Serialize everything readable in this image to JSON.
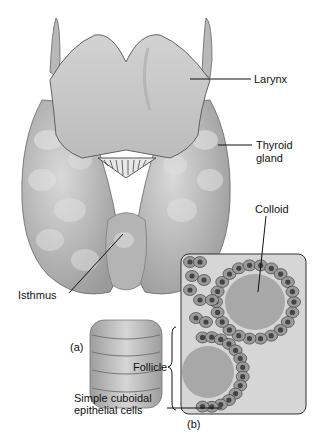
{
  "figure": {
    "panels": [
      {
        "id": "a",
        "label": "(a)",
        "subject": "thyroid gland anterior view"
      },
      {
        "id": "b",
        "label": "(b)",
        "subject": "thyroid follicles histology"
      }
    ]
  },
  "labels": {
    "larynx": "Larynx",
    "thyroid_line1": "Thyroid",
    "thyroid_line2": "gland",
    "colloid": "Colloid",
    "isthmus": "Isthmus",
    "follicle": "Follicle",
    "cells_line1": "Simple cuboidal",
    "cells_line2": "epithelial cells",
    "panel_a": "(a)",
    "panel_b": "(b)"
  },
  "colors": {
    "tissue": "#bdbdbd",
    "tissue_dark": "#8a8a8a",
    "tissue_light": "#d8d8d8",
    "colloid": "#a6a6a6",
    "cell": "#9b9b9b",
    "nucleus": "#444444",
    "leader": "#111111"
  }
}
